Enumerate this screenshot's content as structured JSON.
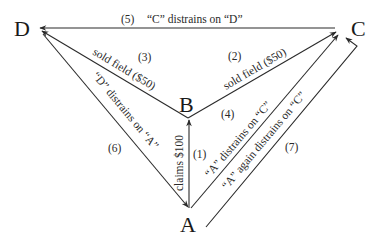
{
  "nodes": {
    "A": "A",
    "B": "B",
    "C": "C",
    "D": "D"
  },
  "edges": [
    {
      "id": "1",
      "number": "(1)",
      "from": "A",
      "to": "B",
      "label": "claims $100"
    },
    {
      "id": "2",
      "number": "(2)",
      "from": "B",
      "to": "C",
      "label": "sold field ($50)"
    },
    {
      "id": "3",
      "number": "(3)",
      "from": "B",
      "to": "D",
      "label": "sold field ($50)"
    },
    {
      "id": "4",
      "number": "(4)",
      "from": "A",
      "to": "C",
      "label": "“A” distrains on “C”"
    },
    {
      "id": "5",
      "number": "(5)",
      "from": "C",
      "to": "D",
      "label": "“C” distrains on “D”"
    },
    {
      "id": "6",
      "number": "(6)",
      "from": "D",
      "to": "A",
      "label": "“D” distrains on “A”"
    },
    {
      "id": "7",
      "number": "(7)",
      "from": "A",
      "to": "C",
      "label": "“A” again distrains on “C”"
    }
  ],
  "colors": {
    "line": "#2a2a2a",
    "text": "#1a1a1a",
    "background": "#ffffff"
  }
}
